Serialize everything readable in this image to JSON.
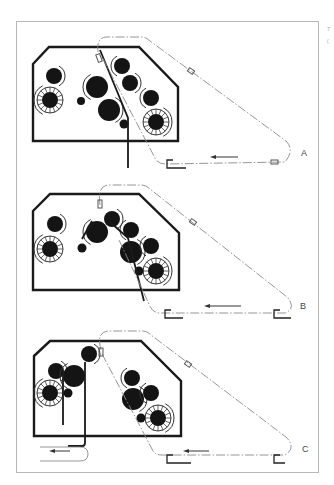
{
  "figure": {
    "corner_marks": [
      "7",
      "("
    ],
    "panels": [
      {
        "id": "A",
        "label": "A",
        "offset_y": 0,
        "rollers": [
          {
            "cx": 54,
            "cy": 76,
            "r": 8
          },
          {
            "cx": 50,
            "cy": 100,
            "r": 8,
            "ring": true
          },
          {
            "cx": 81,
            "cy": 101,
            "r": 4
          },
          {
            "cx": 97,
            "cy": 87,
            "r": 11
          },
          {
            "cx": 109,
            "cy": 110,
            "r": 11
          },
          {
            "cx": 122,
            "cy": 66,
            "r": 8
          },
          {
            "cx": 130,
            "cy": 83,
            "r": 8
          },
          {
            "cx": 151,
            "cy": 98,
            "r": 8
          },
          {
            "cx": 156,
            "cy": 122,
            "r": 8,
            "ring": true
          },
          {
            "cx": 124,
            "cy": 124,
            "r": 4.5
          }
        ]
      },
      {
        "id": "B",
        "label": "B",
        "offset_y": 0,
        "rollers": [
          {
            "cx": 55,
            "cy": 224,
            "r": 8
          },
          {
            "cx": 50,
            "cy": 249,
            "r": 8,
            "ring": true
          },
          {
            "cx": 82,
            "cy": 248,
            "r": 4.5
          },
          {
            "cx": 97,
            "cy": 232,
            "r": 11
          },
          {
            "cx": 112,
            "cy": 219,
            "r": 8
          },
          {
            "cx": 131,
            "cy": 230,
            "r": 8
          },
          {
            "cx": 131,
            "cy": 252,
            "r": 11
          },
          {
            "cx": 151,
            "cy": 246,
            "r": 8
          },
          {
            "cx": 156,
            "cy": 271,
            "r": 8,
            "ring": true
          },
          {
            "cx": 139,
            "cy": 271,
            "r": 4.5
          }
        ]
      },
      {
        "id": "C",
        "label": "C",
        "offset_y": 0,
        "rollers": [
          {
            "cx": 56,
            "cy": 371,
            "r": 8
          },
          {
            "cx": 74,
            "cy": 376,
            "r": 11
          },
          {
            "cx": 89,
            "cy": 354,
            "r": 8
          },
          {
            "cx": 50,
            "cy": 393,
            "r": 8,
            "ring": true
          },
          {
            "cx": 68,
            "cy": 393,
            "r": 4.5
          },
          {
            "cx": 132,
            "cy": 378,
            "r": 8
          },
          {
            "cx": 133,
            "cy": 399,
            "r": 11
          },
          {
            "cx": 151,
            "cy": 393,
            "r": 8
          },
          {
            "cx": 158,
            "cy": 418,
            "r": 8,
            "ring": true
          },
          {
            "cx": 141,
            "cy": 418,
            "r": 4.5
          }
        ]
      }
    ]
  }
}
